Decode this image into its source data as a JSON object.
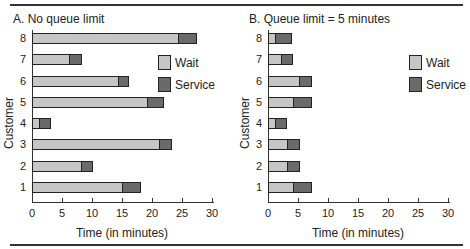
{
  "chart_data": [
    {
      "type": "bar",
      "orientation": "horizontal",
      "stacked": true,
      "title": "A. No queue limit",
      "xlabel": "Time (in minutes)",
      "ylabel": "Customer",
      "xlim": [
        0,
        30
      ],
      "xticks": [
        0,
        5,
        10,
        15,
        20,
        25,
        30
      ],
      "categories": [
        "1",
        "2",
        "3",
        "4",
        "5",
        "6",
        "7",
        "8"
      ],
      "series": [
        {
          "name": "Wait",
          "color": "#c6c6c6",
          "values": [
            14.8,
            8,
            21,
            1,
            19,
            14.2,
            6,
            24.2
          ]
        },
        {
          "name": "Service",
          "color": "#6a6a6a",
          "values": [
            3.4,
            2.2,
            2.3,
            2.2,
            3,
            2,
            2.3,
            3.3
          ]
        }
      ],
      "legend": {
        "position": "upper right",
        "entries": [
          "Wait",
          "Service"
        ]
      },
      "grid": false
    },
    {
      "type": "bar",
      "orientation": "horizontal",
      "stacked": true,
      "title": "B. Queue limit = 5 minutes",
      "xlabel": "Time (in minutes)",
      "ylabel": "Customer",
      "xlim": [
        0,
        30
      ],
      "xticks": [
        0,
        5,
        10,
        15,
        20,
        25,
        30
      ],
      "categories": [
        "1",
        "2",
        "3",
        "4",
        "5",
        "6",
        "7",
        "8"
      ],
      "series": [
        {
          "name": "Wait",
          "color": "#c6c6c6",
          "values": [
            4,
            3,
            3,
            1,
            4,
            5,
            2,
            1
          ]
        },
        {
          "name": "Service",
          "color": "#6a6a6a",
          "values": [
            3.3,
            2.3,
            2.3,
            2.2,
            3.3,
            2.3,
            2.2,
            3
          ]
        }
      ],
      "legend": {
        "position": "upper right",
        "entries": [
          "Wait",
          "Service"
        ]
      },
      "grid": false
    }
  ],
  "panels": [
    {
      "title": "A. No queue limit",
      "xlabel": "Time (in minutes)",
      "ylabel": "Customer",
      "legend": [
        "Wait",
        "Service"
      ]
    },
    {
      "title": "B. Queue limit = 5 minutes",
      "xlabel": "Time (in minutes)",
      "ylabel": "Customer",
      "legend": [
        "Wait",
        "Service"
      ]
    }
  ]
}
